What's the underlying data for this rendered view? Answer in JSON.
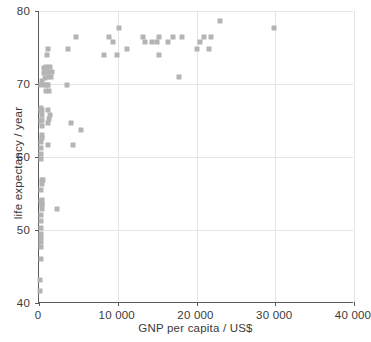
{
  "chart_data": {
    "type": "scatter",
    "title": "",
    "xlabel": "GNP per capita / US$",
    "ylabel": "life expectancy / year",
    "xlim": [
      0,
      40000
    ],
    "ylim": [
      40,
      80
    ],
    "xticks": [
      0,
      10000,
      20000,
      30000,
      40000
    ],
    "xtick_labels": [
      "0",
      "10 000",
      "20 000",
      "30 000",
      "40 000"
    ],
    "yticks": [
      40,
      50,
      60,
      70,
      80
    ],
    "ytick_labels": [
      "40",
      "50",
      "60",
      "70",
      "80"
    ],
    "grid": true,
    "legend": null,
    "marker": "square",
    "marker_color": "#b4b4b4",
    "series": [
      {
        "name": "countries",
        "points": [
          [
            150,
            41.7
          ],
          [
            170,
            43.2
          ],
          [
            200,
            46.0
          ],
          [
            230,
            47.7
          ],
          [
            250,
            48.3
          ],
          [
            210,
            48.9
          ],
          [
            260,
            49.4
          ],
          [
            300,
            50.3
          ],
          [
            240,
            51.2
          ],
          [
            280,
            52.1
          ],
          [
            330,
            52.9
          ],
          [
            390,
            53.4
          ],
          [
            420,
            53.5
          ],
          [
            2300,
            52.9
          ],
          [
            310,
            54.0
          ],
          [
            360,
            54.1
          ],
          [
            300,
            55.5
          ],
          [
            340,
            56.3
          ],
          [
            400,
            56.9
          ],
          [
            450,
            56.9
          ],
          [
            200,
            59.7
          ],
          [
            250,
            60.4
          ],
          [
            300,
            61.2
          ],
          [
            1200,
            61.6
          ],
          [
            4300,
            61.6
          ],
          [
            260,
            62.0
          ],
          [
            330,
            62.6
          ],
          [
            420,
            63.0
          ],
          [
            5300,
            63.7
          ],
          [
            350,
            64.3
          ],
          [
            1100,
            64.6
          ],
          [
            4000,
            64.7
          ],
          [
            300,
            65.0
          ],
          [
            380,
            65.1
          ],
          [
            1300,
            65.2
          ],
          [
            400,
            65.7
          ],
          [
            1400,
            65.8
          ],
          [
            280,
            66.3
          ],
          [
            350,
            66.4
          ],
          [
            1100,
            66.4
          ],
          [
            300,
            66.7
          ],
          [
            900,
            69.0
          ],
          [
            1300,
            69.1
          ],
          [
            250,
            69.8
          ],
          [
            800,
            69.9
          ],
          [
            1000,
            69.9
          ],
          [
            1200,
            69.9
          ],
          [
            3500,
            69.8
          ],
          [
            350,
            70.4
          ],
          [
            700,
            70.8
          ],
          [
            1100,
            70.9
          ],
          [
            1500,
            70.9
          ],
          [
            17800,
            70.9
          ],
          [
            650,
            71.5
          ],
          [
            950,
            71.6
          ],
          [
            1300,
            71.6
          ],
          [
            1600,
            71.6
          ],
          [
            600,
            72.2
          ],
          [
            900,
            72.3
          ],
          [
            1400,
            72.3
          ],
          [
            1000,
            74.0
          ],
          [
            8300,
            74.0
          ],
          [
            9900,
            74.0
          ],
          [
            15300,
            74.0
          ],
          [
            1200,
            74.8
          ],
          [
            3700,
            74.8
          ],
          [
            11200,
            74.8
          ],
          [
            20100,
            74.8
          ],
          [
            21600,
            74.8
          ],
          [
            4700,
            76.5
          ],
          [
            8900,
            76.5
          ],
          [
            13200,
            76.5
          ],
          [
            15200,
            76.5
          ],
          [
            17000,
            76.5
          ],
          [
            18100,
            76.5
          ],
          [
            21000,
            76.5
          ],
          [
            21900,
            76.5
          ],
          [
            9400,
            75.7
          ],
          [
            13500,
            75.7
          ],
          [
            14300,
            75.7
          ],
          [
            15000,
            75.7
          ],
          [
            16400,
            75.7
          ],
          [
            20400,
            75.7
          ],
          [
            10100,
            77.7
          ],
          [
            29800,
            77.7
          ],
          [
            23000,
            78.6
          ]
        ]
      }
    ]
  }
}
